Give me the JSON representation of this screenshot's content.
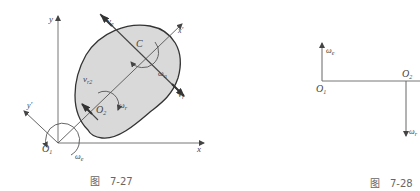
{
  "figure_left": {
    "caption_prefix": "图",
    "caption_number": "7-27",
    "labels": {
      "y_axis": "y",
      "x_axis": "x",
      "y_prime": "y'",
      "x_prime": "x'",
      "origin_1": "O",
      "origin_1_sub": "1",
      "origin_2": "O",
      "origin_2_sub": "2",
      "center": "C",
      "v_e": "v",
      "v_e_sub": "e",
      "v_r": "v",
      "v_r_sub": "r",
      "v_r2": "v",
      "v_r2_sub": "r2",
      "omega_e": "ω",
      "omega_e_sub": "e",
      "omega_r": "ω",
      "omega_r_sub": "r",
      "omega_a": "ω",
      "omega_a_sub": "a"
    }
  },
  "figure_right": {
    "caption_prefix": "图",
    "caption_number": "7-28",
    "labels": {
      "origin_1": "O",
      "origin_1_sub": "1",
      "origin_2": "O",
      "origin_2_sub": "2",
      "omega_e": "ω",
      "omega_e_sub": "e",
      "omega_r": "ω",
      "omega_r_sub": "r"
    }
  },
  "colors": {
    "line": "#555555",
    "body_fill": "#d9d9d9",
    "body_stroke": "#333333",
    "caption": "#666666"
  }
}
